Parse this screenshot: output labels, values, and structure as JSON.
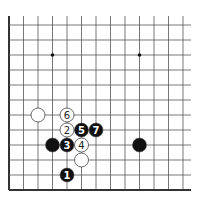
{
  "diagram": {
    "type": "go-board-fragment",
    "corner": "bottom-left",
    "grid": {
      "cols": 13,
      "rows": 12,
      "x0": 9,
      "y_bottom": 190,
      "spacing_x": 14.5,
      "spacing_y": 15.0,
      "right_extent": 191,
      "top_extent": 16
    },
    "star_points": [
      {
        "col": 3,
        "row": 9
      },
      {
        "col": 9,
        "row": 9
      }
    ],
    "stones": [
      {
        "color": "white",
        "col": 2,
        "row": 5,
        "label": ""
      },
      {
        "color": "white",
        "col": 4,
        "row": 5,
        "label": "6"
      },
      {
        "color": "white",
        "col": 4,
        "row": 4,
        "label": "2"
      },
      {
        "color": "black",
        "col": 5,
        "row": 4,
        "label": "5"
      },
      {
        "color": "black",
        "col": 6,
        "row": 4,
        "label": "7"
      },
      {
        "color": "black",
        "col": 3,
        "row": 3,
        "label": ""
      },
      {
        "color": "black",
        "col": 4,
        "row": 3,
        "label": "3"
      },
      {
        "color": "white",
        "col": 5,
        "row": 3,
        "label": "4"
      },
      {
        "color": "white",
        "col": 5,
        "row": 2,
        "label": ""
      },
      {
        "color": "black",
        "col": 4,
        "row": 1,
        "label": "1"
      },
      {
        "color": "black",
        "col": 9,
        "row": 3,
        "label": ""
      }
    ],
    "colors": {
      "line": "#555555",
      "edge": "#333333",
      "black_stone": "#111111",
      "white_stone": "#ffffff",
      "stone_outline": "#444444"
    }
  }
}
